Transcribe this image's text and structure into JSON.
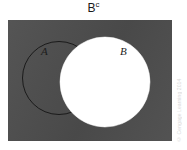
{
  "figure": {
    "title_base": "B",
    "title_superscript": "c",
    "title_full": "Bᶜ",
    "caption_meaning": "Shaded region is B complement",
    "background_color": "#ffffff"
  },
  "universe": {
    "name": "universal-set-rectangle",
    "fill_color": "#4d4d4d",
    "shaded": true
  },
  "sets": [
    {
      "id": "A",
      "label": "A",
      "fill_color": "#4d4d4d",
      "stroke_color": "#141414",
      "filled_white": false
    },
    {
      "id": "B",
      "label": "B",
      "fill_color": "#ffffff",
      "stroke_color": "#ffffff",
      "filled_white": true
    }
  ],
  "credit": {
    "text": "© Cengage Learning 2014"
  },
  "colors": {
    "shade": "#4d4d4d",
    "white": "#ffffff",
    "outline": "#141414",
    "text": "#1a1a1a"
  }
}
